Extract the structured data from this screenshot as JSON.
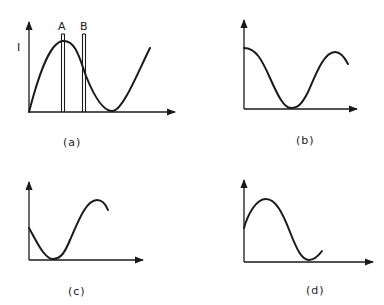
{
  "figure": {
    "panels": [
      {
        "id": "a",
        "caption": "(a)",
        "y_axis_label": "I",
        "markers": [
          {
            "label": "A"
          },
          {
            "label": "B"
          }
        ],
        "curve_description": "starts at origin, rises to maximum near marker A, falls through marker B to minimum, then rises again"
      },
      {
        "id": "b",
        "caption": "(b)",
        "curve_description": "starts at maximum on axis, falls to minimum, rises to second maximum, begins to fall"
      },
      {
        "id": "c",
        "caption": "(c)",
        "curve_description": "starts at mid height, falls to minimum, rises to maximum, begins to fall"
      },
      {
        "id": "d",
        "caption": "(d)",
        "curve_description": "starts at mid height, rises to maximum, falls to minimum, begins to rise"
      }
    ],
    "colors": {
      "ink": "#1a1a1a",
      "background": "#ffffff"
    }
  }
}
